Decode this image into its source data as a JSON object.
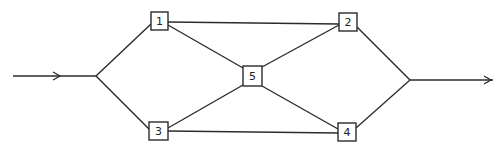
{
  "diagram": {
    "type": "bridge-network",
    "colors": {
      "line": "#2b2b2b",
      "background": "#ffffff",
      "text": "#222222"
    },
    "nodes": [
      {
        "id": "1",
        "label": "1",
        "x": 159,
        "y": 21
      },
      {
        "id": "2",
        "label": "2",
        "x": 348,
        "y": 22
      },
      {
        "id": "3",
        "label": "3",
        "x": 158,
        "y": 131
      },
      {
        "id": "4",
        "label": "4",
        "x": 347,
        "y": 132
      },
      {
        "id": "5",
        "label": "5",
        "x": 252,
        "y": 76
      }
    ],
    "junctions": [
      {
        "id": "input-junction",
        "x": 96,
        "y": 76
      },
      {
        "id": "output-junction",
        "x": 410,
        "y": 80
      }
    ],
    "edges": [
      {
        "from": "input-junction",
        "to": "1"
      },
      {
        "from": "input-junction",
        "to": "3"
      },
      {
        "from": "1",
        "to": "2"
      },
      {
        "from": "3",
        "to": "4"
      },
      {
        "from": "1",
        "to": "5"
      },
      {
        "from": "3",
        "to": "5"
      },
      {
        "from": "5",
        "to": "2"
      },
      {
        "from": "5",
        "to": "4"
      },
      {
        "from": "2",
        "to": "output-junction"
      },
      {
        "from": "4",
        "to": "output-junction"
      }
    ],
    "input_arrow": {
      "x1": 13,
      "y1": 76,
      "x2": 96,
      "y2": 76,
      "head_x": 60
    },
    "output_arrow": {
      "x1": 410,
      "y1": 80,
      "x2": 493,
      "y2": 80,
      "head_x": 490
    }
  }
}
